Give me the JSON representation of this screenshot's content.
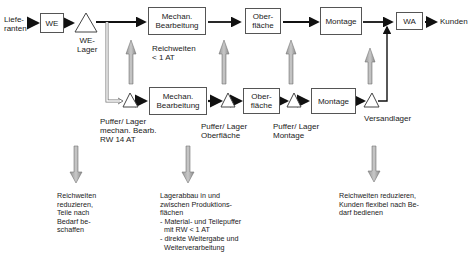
{
  "diagram": {
    "type": "material-flow",
    "top_row": {
      "source": "Liefe-\nranten",
      "nodes": [
        "WE",
        "WE-\nLager",
        "Mechan.\nBearbeitung",
        "Ober-\nfläche",
        "Montage",
        "WA"
      ],
      "sink": "Kunden",
      "annotation": "Reichweiten\n< 1 AT"
    },
    "bottom_row": {
      "nodes": [
        "Mechan.\nBearbeitung",
        "Ober-\nfläche",
        "Montage"
      ],
      "buffers": [
        "Puffer/ Lager\nmechan. Bearb.\nRW 14 AT",
        "Puffer/ Lager\nOberfläche",
        "Puffer/ Lager\nMontage",
        "Versandlager"
      ]
    },
    "measures": [
      "Reichweiten\nreduzieren,\nTeile nach\nBedarf be-\nschaffen",
      "Lagerabbau in und\nzwischen Produktions-\nflächen\n- Material- und Teilepuffer\n  mit RW < 1 AT\n- direkte Weitergabe und\n  Weiterverarbeitung",
      "Reichweiten reduzieren,\nKunden flexibel nach Be-\ndarf bedienen"
    ]
  }
}
